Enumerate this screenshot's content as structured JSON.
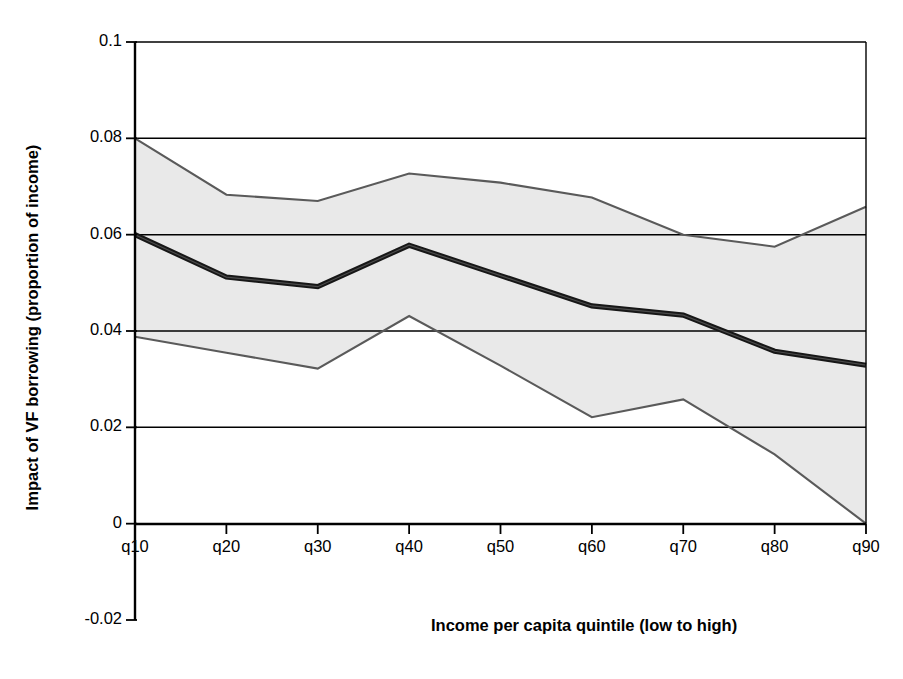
{
  "chart_data": {
    "type": "area",
    "title": "",
    "subtitle": "",
    "xlabel": "Income per capita quintile (low to high)",
    "ylabel": "Impact of VF borrowing (proportion of income)",
    "categories": [
      "q10",
      "q20",
      "q30",
      "q40",
      "q50",
      "q60",
      "q70",
      "q80",
      "q90"
    ],
    "x_tick_labels": [
      "q10",
      "q20",
      "q30",
      "q40",
      "q50",
      "q60",
      "q70",
      "q80",
      "q90"
    ],
    "y_tick_labels": [
      "0.1",
      "0.08",
      "0.06",
      "0.04",
      "0.02",
      "0",
      "-0.02"
    ],
    "y_tick_values": [
      0.1,
      0.08,
      0.06,
      0.04,
      0.02,
      0,
      -0.02
    ],
    "ylim": [
      -0.02,
      0.1
    ],
    "grid": "horizontal",
    "legend": "none",
    "series": [
      {
        "name": "Upper confidence bound",
        "values": [
          0.08,
          0.0683,
          0.067,
          0.0727,
          0.0708,
          0.0677,
          0.06,
          0.0575,
          0.0658
        ]
      },
      {
        "name": "Point estimate",
        "values": [
          0.06,
          0.0512,
          0.0492,
          0.0578,
          0.0515,
          0.0452,
          0.0433,
          0.0358,
          0.0329
        ]
      },
      {
        "name": "Lower confidence bound",
        "values": [
          0.0388,
          0.0355,
          0.0322,
          0.0431,
          0.0328,
          0.0221,
          0.0258,
          0.0144,
          0.0
        ]
      }
    ],
    "colors": {
      "band_fill": "#e8e8e8",
      "band_edge": "#555555",
      "center_line": "#1a1a1a",
      "grid_line": "#000000",
      "axis_line": "#000000",
      "background": "#ffffff"
    }
  }
}
